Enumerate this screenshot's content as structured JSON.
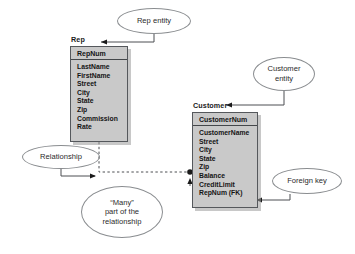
{
  "diagram": {
    "type": "er-diagram",
    "background_color": "#ffffff",
    "entity_fill_color": "#c9c9c9",
    "line_color": "#4c4f52"
  },
  "entities": [
    {
      "name": "Rep",
      "primary_key": "RepNum",
      "attributes": [
        "LastName",
        "FirstName",
        "Street",
        "City",
        "State",
        "Zip",
        "Commission",
        "Rate"
      ]
    },
    {
      "name": "Customer",
      "primary_key": "CustomerNum",
      "attributes": [
        "CustomerName",
        "Street",
        "City",
        "State",
        "Zip",
        "Balance",
        "CreditLimit",
        "RepNum (FK)"
      ]
    }
  ],
  "callouts": [
    {
      "id": "rep_entity",
      "text": "Rep entity",
      "points_to": "Rep"
    },
    {
      "id": "customer_entity",
      "text": "Customer\nentity",
      "points_to": "Customer"
    },
    {
      "id": "relationship",
      "text": "Relationship",
      "points_to": "relationship-line"
    },
    {
      "id": "many_part",
      "text": "“Many”\npart of the\nrelationship",
      "points_to": "many-dot"
    },
    {
      "id": "foreign_key",
      "text": "Foreign key",
      "points_to": "RepNum (FK)"
    }
  ],
  "relationship": {
    "from": "Rep",
    "to": "Customer",
    "cardinality": "one-to-many",
    "many_marker": "filled-dot",
    "line_style": "dashed"
  }
}
